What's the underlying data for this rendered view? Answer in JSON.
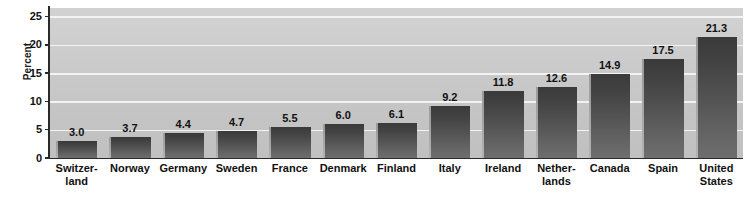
{
  "chart_data": {
    "type": "bar",
    "title": "",
    "xlabel": "",
    "ylabel": "Percent",
    "ylim": [
      0,
      26.5
    ],
    "yticks": [
      0,
      5,
      10,
      15,
      20,
      25
    ],
    "ytick_labels": [
      "0",
      "5",
      "10",
      "15",
      "20",
      "25"
    ],
    "grid": true,
    "legend": false,
    "categories": [
      "Switzerland",
      "Norway",
      "Germany",
      "Sweden",
      "France",
      "Denmark",
      "Finland",
      "Italy",
      "Ireland",
      "Netherlands",
      "Canada",
      "Spain",
      "United States"
    ],
    "category_label_lines": [
      [
        "Switzer-",
        "land"
      ],
      [
        "Norway"
      ],
      [
        "Germany"
      ],
      [
        "Sweden"
      ],
      [
        "France"
      ],
      [
        "Denmark"
      ],
      [
        "Finland"
      ],
      [
        "Italy"
      ],
      [
        "Ireland"
      ],
      [
        "Nether-",
        "lands"
      ],
      [
        "Canada"
      ],
      [
        "Spain"
      ],
      [
        "United",
        "States"
      ]
    ],
    "values": [
      3.0,
      3.7,
      4.4,
      4.7,
      5.5,
      6.0,
      6.1,
      9.2,
      11.8,
      12.6,
      14.9,
      17.5,
      21.3
    ],
    "value_labels": [
      "3.0",
      "3.7",
      "4.4",
      "4.7",
      "5.5",
      "6.0",
      "6.1",
      "9.2",
      "11.8",
      "12.6",
      "14.9",
      "17.5",
      "21.3"
    ]
  },
  "colors": {
    "plot_background": "#c9c9c9",
    "gridline": "#f3f3f3",
    "bar_dark": "#3a3a3a",
    "bar_light": "#6e6e6e",
    "axis": "#2a2a2a",
    "text": "#111111",
    "page_background": "#ffffff"
  }
}
